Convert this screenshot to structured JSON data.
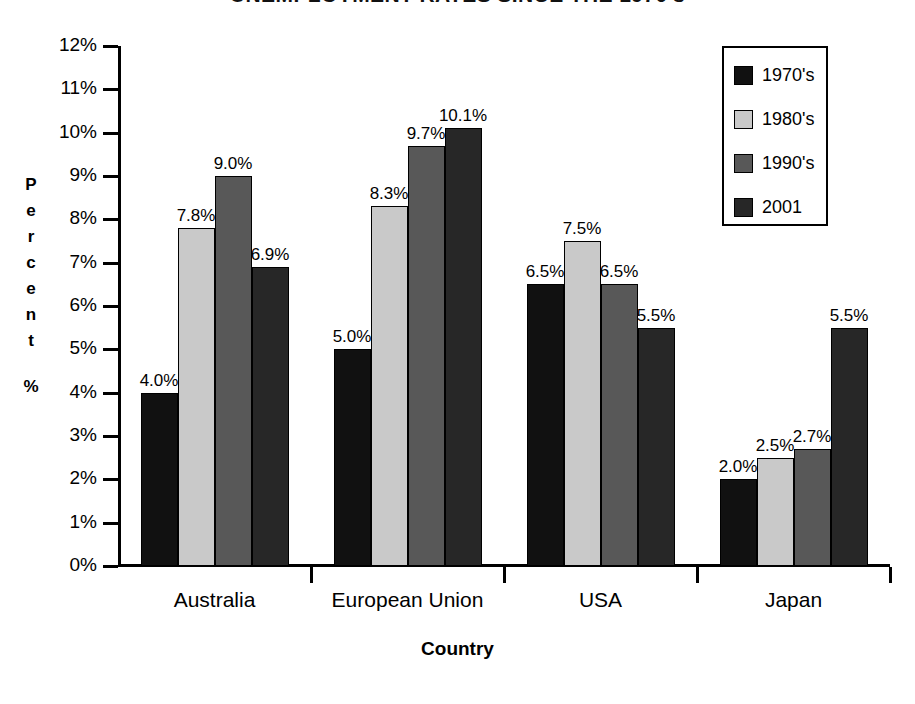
{
  "chart_data": {
    "type": "bar",
    "title": "UNEMPLOYMENT RATES SINCE THE 1970's",
    "xlabel": "Country",
    "ylabel": "Percent",
    "ylabel_unit": "%",
    "categories": [
      "Australia",
      "European Union",
      "USA",
      "Japan"
    ],
    "series": [
      {
        "name": "1970's",
        "color": "#111111",
        "values": [
          4.0,
          5.0,
          6.5,
          2.0
        ],
        "labels": [
          "4.0%",
          "5.0%",
          "6.5%",
          "2.0%"
        ]
      },
      {
        "name": "1980's",
        "color": "#c9c9c9",
        "values": [
          7.8,
          8.3,
          7.5,
          2.5
        ],
        "labels": [
          "7.8%",
          "8.3%",
          "7.5%",
          "2.5%"
        ]
      },
      {
        "name": "1990's",
        "color": "#585858",
        "values": [
          9.0,
          9.7,
          6.5,
          2.7
        ],
        "labels": [
          "9.0%",
          "9.7%",
          "6.5%",
          "2.7%"
        ]
      },
      {
        "name": "2001",
        "color": "#272727",
        "values": [
          6.9,
          10.1,
          5.5,
          5.5
        ],
        "labels": [
          "6.9%",
          "10.1%",
          "5.5%",
          "5.5%"
        ]
      }
    ],
    "ylim": [
      0,
      12
    ],
    "ytick_step": 1,
    "ytick_labels": [
      "12%",
      "11%",
      "10%",
      "9%",
      "8%",
      "7%",
      "6%",
      "5%",
      "4%",
      "3%",
      "2%",
      "1%",
      "0%"
    ],
    "ytick_values": [
      12,
      11,
      10,
      9,
      8,
      7,
      6,
      5,
      4,
      3,
      2,
      1,
      0
    ],
    "grid": false,
    "legend_position": "top-right"
  }
}
